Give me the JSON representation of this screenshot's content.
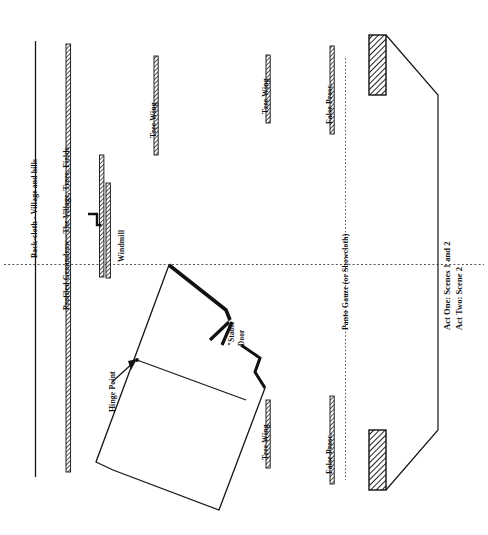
{
  "drawing": {
    "type": "theatre-stage-ground-plan",
    "title_lines": [
      "Act One: Scenes 1 and 2",
      "Act Two: Scene 2"
    ],
    "labels": {
      "backcloth": "Back-cloth - Village and hills",
      "groundrow": "Profiled Groundrow - The Village, Trees, Fields",
      "windmill": "Windmill",
      "tree_wing_upstage": "Tree Wing",
      "tree_wing_downstage": "Tree Wing",
      "tree_wing_lower": "Tree Wing",
      "false_prosc_upper": "False Prosc.",
      "false_prosc_lower": "False Prosc.",
      "panto_gauze": "Panto Gauze (or Showcloth)",
      "hinge_point": "Hinge Point",
      "stable_door_line1": "\"Stable\"",
      "stable_door_line2": "Door"
    },
    "colors": {
      "ink": "#111111",
      "paper": "#ffffff",
      "hatch": "#2b2b2b",
      "dotted": "#5a5a5a"
    },
    "elements": [
      {
        "name": "back-cloth",
        "kind": "solid-line"
      },
      {
        "name": "profiled-groundrow",
        "kind": "hatched-band"
      },
      {
        "name": "windmill-flat",
        "kind": "hatched-band-with-hook"
      },
      {
        "name": "tree-wing",
        "kind": "hatched-band"
      },
      {
        "name": "panto-gauze",
        "kind": "dotted-line"
      },
      {
        "name": "false-proscenium",
        "kind": "hatched-band"
      },
      {
        "name": "proscenium-wall",
        "kind": "hatched-block"
      },
      {
        "name": "cottage-truck",
        "kind": "polygon-outline"
      },
      {
        "name": "stage-floor",
        "kind": "polygon-outline"
      },
      {
        "name": "centre-line",
        "kind": "dotted-line"
      }
    ]
  }
}
